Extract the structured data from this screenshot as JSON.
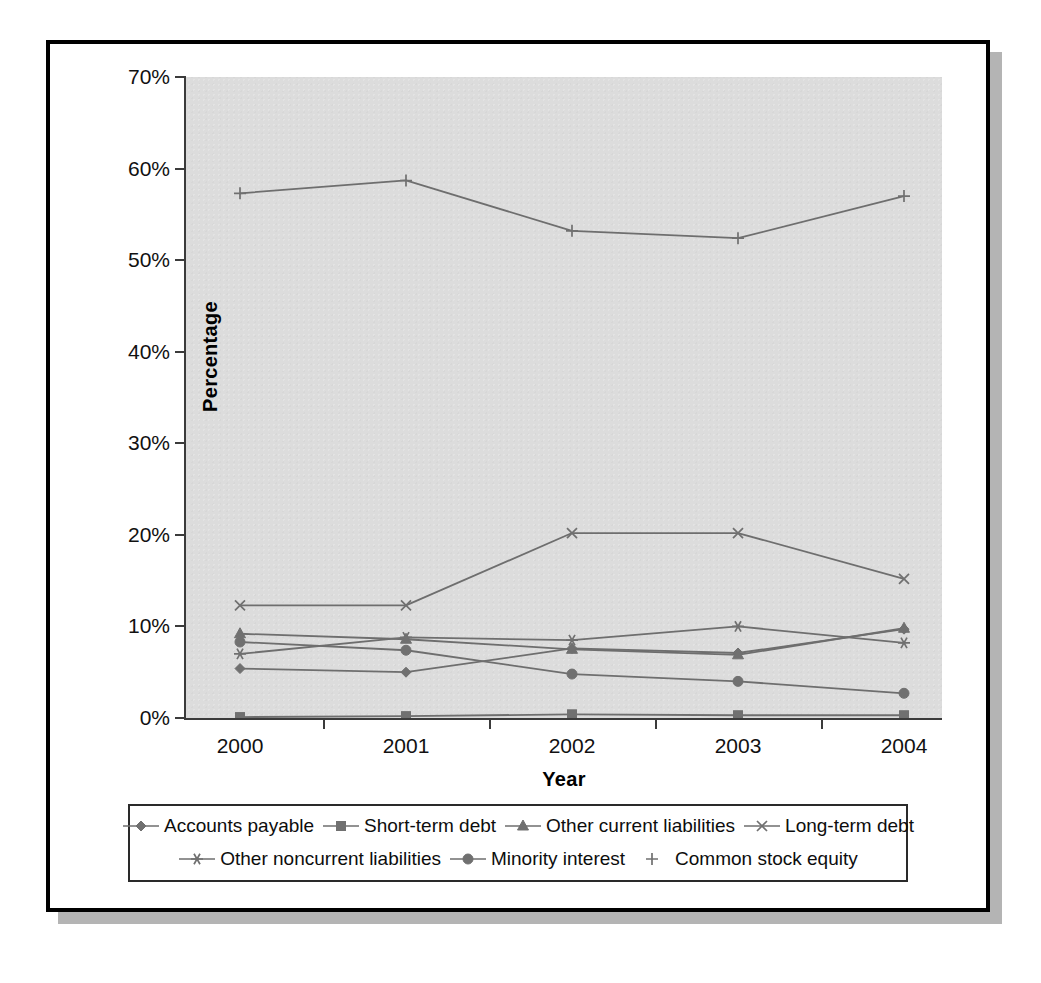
{
  "chart_data": {
    "type": "line",
    "title": "",
    "xlabel": "Year",
    "ylabel": "Percentage",
    "categories": [
      "2000",
      "2001",
      "2002",
      "2003",
      "2004"
    ],
    "x": [
      2000,
      2001,
      2002,
      2003,
      2004
    ],
    "ylim": [
      0,
      70
    ],
    "ytick_labels": [
      "0%",
      "10%",
      "20%",
      "30%",
      "40%",
      "50%",
      "60%",
      "70%"
    ],
    "ytick_values": [
      0,
      10,
      20,
      30,
      40,
      50,
      60,
      70
    ],
    "grid": false,
    "legend_position": "bottom",
    "value_unit": "percent",
    "series": [
      {
        "name": "Accounts payable",
        "marker": "diamond",
        "values": [
          5.4,
          5.0,
          7.6,
          7.1,
          9.7
        ]
      },
      {
        "name": "Short-term debt",
        "marker": "square",
        "values": [
          0.1,
          0.2,
          0.4,
          0.3,
          0.3
        ]
      },
      {
        "name": "Other current liabilities",
        "marker": "triangle",
        "values": [
          9.2,
          8.6,
          7.5,
          6.9,
          9.8
        ]
      },
      {
        "name": "Long-term debt",
        "marker": "x",
        "values": [
          12.3,
          12.3,
          20.2,
          20.2,
          15.2
        ]
      },
      {
        "name": "Other noncurrent liabilities",
        "marker": "asterisk",
        "values": [
          7.0,
          8.8,
          8.5,
          10.0,
          8.2
        ]
      },
      {
        "name": "Minority interest",
        "marker": "circle",
        "values": [
          8.3,
          7.4,
          4.8,
          4.0,
          2.7
        ]
      },
      {
        "name": "Common stock equity",
        "marker": "plus",
        "values": [
          57.3,
          58.7,
          53.2,
          52.4,
          57.0
        ]
      }
    ],
    "colors": {
      "plot_background": "#dcdcdc",
      "axis": "#3b3b3b",
      "series_line": "#6e6e6e",
      "marker": "#707070",
      "frame": "#000000",
      "page_background": "#ffffff",
      "shadow": "#b4b4b4"
    }
  }
}
